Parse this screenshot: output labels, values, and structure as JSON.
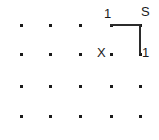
{
  "figure": {
    "type": "grid-path-diagram",
    "background_color": "#ffffff",
    "ink_color": "#1a1a1a",
    "width": 159,
    "height": 140,
    "grid": {
      "columns": 5,
      "rows": 4,
      "column_x": [
        20,
        49,
        79,
        110,
        139
      ],
      "row_y": [
        24,
        53,
        85,
        115
      ],
      "dot_size": 3,
      "dot_color": "#1a1a1a",
      "nodes": [
        {
          "id": "r0c0",
          "x": 20,
          "y": 24
        },
        {
          "id": "r0c1",
          "x": 49,
          "y": 24
        },
        {
          "id": "r0c2",
          "x": 79,
          "y": 24
        },
        {
          "id": "r0c3",
          "x": 110,
          "y": 24
        },
        {
          "id": "r0c4",
          "x": 139,
          "y": 24
        },
        {
          "id": "r1c0",
          "x": 20,
          "y": 53
        },
        {
          "id": "r1c1",
          "x": 49,
          "y": 53
        },
        {
          "id": "r1c2",
          "x": 79,
          "y": 53
        },
        {
          "id": "r1c3",
          "x": 110,
          "y": 53
        },
        {
          "id": "r1c4",
          "x": 139,
          "y": 53
        },
        {
          "id": "r2c0",
          "x": 20,
          "y": 85
        },
        {
          "id": "r2c1",
          "x": 49,
          "y": 85
        },
        {
          "id": "r2c2",
          "x": 79,
          "y": 85
        },
        {
          "id": "r2c3",
          "x": 110,
          "y": 85
        },
        {
          "id": "r2c4",
          "x": 139,
          "y": 85
        },
        {
          "id": "r3c0",
          "x": 20,
          "y": 115
        },
        {
          "id": "r3c1",
          "x": 49,
          "y": 115
        },
        {
          "id": "r3c2",
          "x": 79,
          "y": 115
        },
        {
          "id": "r3c3",
          "x": 110,
          "y": 115
        },
        {
          "id": "r3c4",
          "x": 139,
          "y": 115
        }
      ]
    },
    "path": {
      "stroke_color": "#2b2b2b",
      "stroke_width": 2,
      "segments": [
        {
          "id": "top-horizontal",
          "orientation": "horizontal",
          "x1": 110,
          "y1": 24,
          "x2": 139,
          "y2": 24,
          "length_label": "1"
        },
        {
          "id": "right-vertical",
          "orientation": "vertical",
          "x1": 139,
          "y1": 24,
          "x2": 139,
          "y2": 53,
          "length_label": "1"
        }
      ]
    },
    "labels": [
      {
        "id": "label-top-left",
        "text": "1",
        "x": 104,
        "y": 7,
        "anchor": "start"
      },
      {
        "id": "label-corner-s",
        "text": "S",
        "x": 141,
        "y": 5,
        "anchor": "start"
      },
      {
        "id": "label-bottom-right",
        "text": "1",
        "x": 142,
        "y": 46,
        "anchor": "start"
      }
    ],
    "markers": [
      {
        "id": "marker-x",
        "text": "X",
        "x": 97,
        "y": 46,
        "describes_node": "r1c3"
      }
    ]
  }
}
